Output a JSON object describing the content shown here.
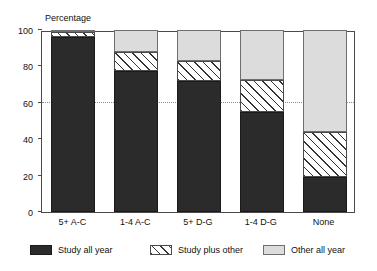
{
  "chart_data": {
    "type": "bar",
    "stacked": true,
    "title": "",
    "subtitle": "",
    "xlabel": "",
    "ylabel": "Percentage",
    "ylim": [
      0,
      100
    ],
    "yticks": [
      0,
      20,
      40,
      60,
      80,
      100
    ],
    "ytick_labels": [
      "0",
      "20",
      "40",
      "60",
      "80",
      "100"
    ],
    "gridlines": [
      60
    ],
    "grid": "dotted horizontal at 60 only",
    "legend_position": "bottom",
    "categories": [
      "5+ A-C",
      "1-4 A-C",
      "5+ D-G",
      "1-4 D-G",
      "None"
    ],
    "series": [
      {
        "name": "Study all year",
        "color": "#2b2b2b",
        "fill": "solid-dark",
        "values": [
          96,
          77.5,
          72,
          55,
          19
        ]
      },
      {
        "name": "Study plus other",
        "color": "#ffffff",
        "fill": "diagonal-hatch",
        "values": [
          3,
          10.5,
          11,
          17.5,
          25
        ]
      },
      {
        "name": "Other all year",
        "color": "#dcdcdc",
        "fill": "solid-light-grey",
        "values": [
          1,
          12,
          17,
          27.5,
          56
        ]
      }
    ]
  },
  "legend": {
    "entries": [
      {
        "label": "Study all year",
        "swatch": "legend-swatch-study-all-year"
      },
      {
        "label": "Study plus other",
        "swatch": "legend-swatch-study-plus-other"
      },
      {
        "label": "Other all year",
        "swatch": "legend-swatch-other-all-year"
      }
    ]
  },
  "colors": {
    "study_all_year": "#2b2b2b",
    "study_plus_other": "#ffffff",
    "other_all_year": "#dcdcdc",
    "axis": "#4a4a4a",
    "grid": "#8a8a8a",
    "background": "#ffffff",
    "text": "#111111"
  }
}
